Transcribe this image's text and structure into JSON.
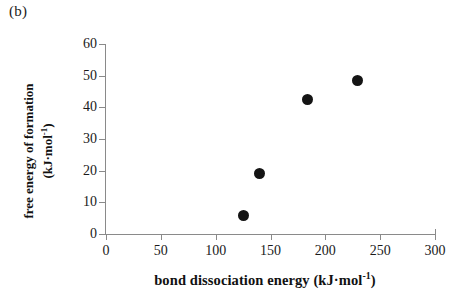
{
  "figure": {
    "panel_label": "(b)"
  },
  "chart_data": {
    "type": "scatter",
    "title": "",
    "xlabel": "bond dissociation energy (kJ·mol⁻¹)",
    "ylabel": "free energy of formation (kJ·mol⁻¹)",
    "ylabel_line1": "free energy of formation",
    "ylabel_line2_prefix": "(kJ·mol",
    "ylabel_line2_sup": "-1",
    "ylabel_line2_suffix": ")",
    "xlabel_prefix": "bond dissociation energy (kJ·mol",
    "xlabel_sup": "-1",
    "xlabel_suffix": ")",
    "xlim": [
      0,
      300
    ],
    "ylim": [
      0,
      60
    ],
    "xticks": [
      0,
      50,
      100,
      150,
      200,
      250,
      300
    ],
    "yticks": [
      0,
      10,
      20,
      30,
      40,
      50,
      60
    ],
    "xtick_labels": [
      "0",
      "50",
      "100",
      "150",
      "200",
      "250",
      "300"
    ],
    "ytick_labels": [
      "0",
      "10",
      "20",
      "30",
      "40",
      "50",
      "60"
    ],
    "grid": false,
    "legend": false,
    "marker": "filled-circle",
    "marker_color": "#141414",
    "axis_color": "#8a8a8a",
    "points": [
      {
        "x": 125,
        "y": 6
      },
      {
        "x": 140,
        "y": 19
      },
      {
        "x": 184,
        "y": 42.5
      },
      {
        "x": 229,
        "y": 48.5
      }
    ]
  }
}
